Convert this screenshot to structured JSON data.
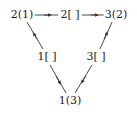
{
  "diagram": {
    "nodes": [
      {
        "id": "n21",
        "label": "2(1)",
        "x": 22,
        "y": 15
      },
      {
        "id": "n2b",
        "label": "2[ ]",
        "x": 70,
        "y": 15
      },
      {
        "id": "n32",
        "label": "3(2)",
        "x": 116,
        "y": 15
      },
      {
        "id": "n1b",
        "label": "1[ ]",
        "x": 47,
        "y": 57
      },
      {
        "id": "n3b",
        "label": "3[ ]",
        "x": 96,
        "y": 57
      },
      {
        "id": "n13",
        "label": "1(3)",
        "x": 70,
        "y": 101
      }
    ],
    "edges": [
      {
        "from": "2(1)",
        "to": "2[ ]",
        "arrow": "right"
      },
      {
        "from": "2[ ]",
        "to": "3(2)",
        "arrow": "right"
      },
      {
        "from": "1[ ]",
        "to": "2(1)",
        "arrow": "up-left"
      },
      {
        "from": "1[ ]",
        "to": "1(3)",
        "arrow": "down-right"
      },
      {
        "from": "3[ ]",
        "to": "3(2)",
        "arrow": "up-right"
      },
      {
        "from": "3[ ]",
        "to": "1(3)",
        "arrow": "down-left"
      }
    ],
    "line_color": "#333333"
  }
}
